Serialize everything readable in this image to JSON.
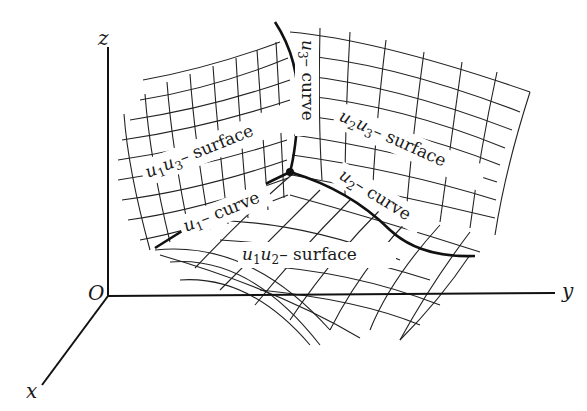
{
  "figure": {
    "type": "curvilinear coordinate system diagram",
    "axes": {
      "z": "z",
      "y": "y",
      "x": "x",
      "origin": "O"
    },
    "surfaces": [
      {
        "id": "u1u3",
        "var_a": "u",
        "sub_a": "1",
        "var_b": "u",
        "sub_b": "3",
        "suffix": "– surface"
      },
      {
        "id": "u2u3",
        "var_a": "u",
        "sub_a": "2",
        "var_b": "u",
        "sub_b": "3",
        "suffix": "– surface"
      },
      {
        "id": "u1u2",
        "var_a": "u",
        "sub_a": "1",
        "var_b": "u",
        "sub_b": "2",
        "suffix": "– surface"
      }
    ],
    "curves": [
      {
        "id": "u1",
        "var": "u",
        "sub": "1",
        "suffix": "– curve"
      },
      {
        "id": "u2",
        "var": "u",
        "sub": "2",
        "suffix": "– curve"
      },
      {
        "id": "u3",
        "var": "u",
        "sub": "3",
        "suffix": "– curve"
      }
    ],
    "colors": {
      "ink": "#1a1a1a",
      "background": "#ffffff"
    }
  }
}
